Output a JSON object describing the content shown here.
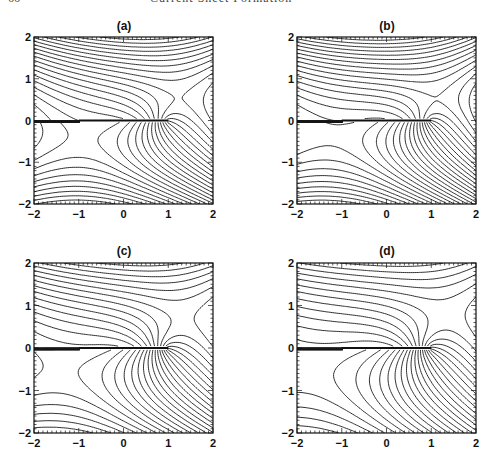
{
  "header": {
    "page_number": "66",
    "running_title": "Current Sheet Formation"
  },
  "chart_data": [
    {
      "type": "contour",
      "title": "(a)",
      "xlabel": "",
      "ylabel": "",
      "xlim": [
        -2,
        2
      ],
      "ylim": [
        -2,
        2
      ],
      "xticks": [
        "-2",
        "-1",
        "0",
        "1",
        "2"
      ],
      "yticks": [
        "-2",
        "-1",
        "0",
        "1",
        "2"
      ],
      "current_sheet": {
        "x": [
          -1,
          1
        ],
        "y": 0
      },
      "null_point": {
        "x": -0.5,
        "y": 0,
        "kind": "X-point"
      },
      "grid": false,
      "frame": {
        "left": 34,
        "top": 37,
        "right": 213,
        "bottom": 204
      },
      "params": {
        "sheet_strength": 1.0,
        "null_x": -0.5
      }
    },
    {
      "type": "contour",
      "title": "(b)",
      "xlabel": "",
      "ylabel": "",
      "xlim": [
        -2,
        2
      ],
      "ylim": [
        -2,
        2
      ],
      "xticks": [
        "-2",
        "-1",
        "0",
        "1",
        "2"
      ],
      "yticks": [
        "-2",
        "-1",
        "0",
        "1",
        "2"
      ],
      "current_sheet": {
        "x": [
          -1,
          1
        ],
        "y": 0
      },
      "null_point": {
        "x": -1,
        "y": 0,
        "kind": "Y-point at sheet end"
      },
      "grid": false,
      "frame": {
        "left": 297,
        "top": 37,
        "right": 476,
        "bottom": 204
      },
      "params": {
        "sheet_strength": 1.0,
        "null_x": -1.0
      }
    },
    {
      "type": "contour",
      "title": "(c)",
      "xlabel": "",
      "ylabel": "",
      "xlim": [
        -2,
        2
      ],
      "ylim": [
        -2,
        2
      ],
      "xticks": [
        "-2",
        "-1",
        "0",
        "1",
        "2"
      ],
      "yticks": [
        "-2",
        "-1",
        "0",
        "1",
        "2"
      ],
      "current_sheet": {
        "x": [
          -1,
          1
        ],
        "y": 0
      },
      "null_point": {
        "x": -1,
        "y": 0,
        "kind": "X-point at sheet end"
      },
      "grid": false,
      "frame": {
        "left": 34,
        "top": 263,
        "right": 213,
        "bottom": 433
      },
      "params": {
        "sheet_strength": 1.6,
        "null_x": -1.0
      }
    },
    {
      "type": "contour",
      "title": "(d)",
      "xlabel": "",
      "ylabel": "",
      "xlim": [
        -2,
        2
      ],
      "ylim": [
        -2,
        2
      ],
      "xticks": [
        "-2",
        "-1",
        "0",
        "1",
        "2"
      ],
      "yticks": [
        "-2",
        "-1",
        "0",
        "1",
        "2"
      ],
      "current_sheet": {
        "x": [
          -1,
          1
        ],
        "y": 0
      },
      "null_point": {
        "x": -1.5,
        "y": 0,
        "kind": "X-point left of sheet"
      },
      "grid": false,
      "frame": {
        "left": 297,
        "top": 263,
        "right": 476,
        "bottom": 433
      },
      "params": {
        "sheet_strength": 2.0,
        "null_x": -1.5
      }
    }
  ]
}
